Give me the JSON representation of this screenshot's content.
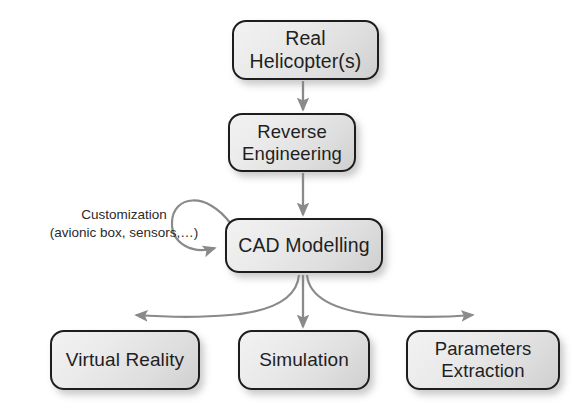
{
  "diagram": {
    "background_color": "#ffffff",
    "node_fill_light": "#f2f2f2",
    "node_fill_dark": "#cfcfcf",
    "node_border_color": "#1d1d1d",
    "text_color": "#1f1f1f",
    "arrow_color": "#8a8a8a",
    "nodes": [
      {
        "id": "real-helicopters",
        "label": "Real Helicopter(s)"
      },
      {
        "id": "reverse-engineering",
        "label": "Reverse\nEngineering"
      },
      {
        "id": "cad-modelling",
        "label": "CAD Modelling"
      },
      {
        "id": "virtual-reality",
        "label": "Virtual Reality"
      },
      {
        "id": "simulation",
        "label": "Simulation"
      },
      {
        "id": "parameters-extraction",
        "label": "Parameters\nExtraction"
      }
    ],
    "annotations": {
      "customization_line1": "Customization",
      "customization_line2": "(avionic box, sensors,…)"
    },
    "edges": [
      {
        "from": "real-helicopters",
        "to": "reverse-engineering",
        "style": "straight-down"
      },
      {
        "from": "reverse-engineering",
        "to": "cad-modelling",
        "style": "straight-down"
      },
      {
        "from": "cad-modelling",
        "to": "cad-modelling",
        "style": "self-loop"
      },
      {
        "from": "cad-modelling",
        "to": "virtual-reality",
        "style": "curve-left"
      },
      {
        "from": "cad-modelling",
        "to": "simulation",
        "style": "straight-down"
      },
      {
        "from": "cad-modelling",
        "to": "parameters-extraction",
        "style": "curve-right"
      }
    ]
  }
}
